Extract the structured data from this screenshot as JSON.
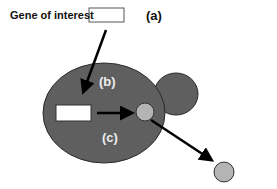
{
  "diagram": {
    "gene_label": "Gene of interest",
    "labels": {
      "a": "(a)",
      "b": "(b)",
      "c": "(c)"
    },
    "colors": {
      "cell": "#5f5f5f",
      "cell_outline": "#2a2a2a",
      "vesicle": "#b4b4b4",
      "arrow": "#000000",
      "box": "#ffffff"
    },
    "elements": [
      "gene-box",
      "mother-cell",
      "bud-cell",
      "inserted-gene-box",
      "internal-vesicle",
      "secreted-vesicle"
    ]
  }
}
